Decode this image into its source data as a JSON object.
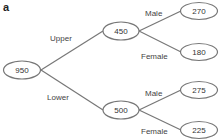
{
  "panel_label": "a",
  "root": {
    "value": "950"
  },
  "level1": [
    {
      "edge_label": "Upper",
      "value": "450",
      "children": [
        {
          "edge_label": "Male",
          "value": "270"
        },
        {
          "edge_label": "Female",
          "value": "180"
        }
      ]
    },
    {
      "edge_label": "Lower",
      "value": "500",
      "children": [
        {
          "edge_label": "Male",
          "value": "275"
        },
        {
          "edge_label": "Female",
          "value": "225"
        }
      ]
    }
  ],
  "colors": {
    "stroke": "#777777",
    "text": "#333333",
    "background": "#ffffff"
  }
}
